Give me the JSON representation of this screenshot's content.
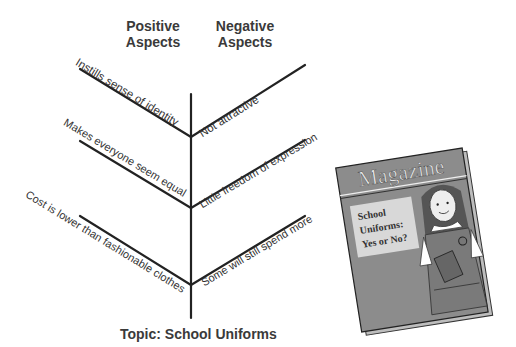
{
  "diagram": {
    "type": "fishbone",
    "headers": {
      "positive": [
        "Positive",
        "Aspects"
      ],
      "negative": [
        "Negative",
        "Aspects"
      ]
    },
    "topic": "Topic: School Uniforms",
    "positive_items": [
      "Instills sense of identity",
      "Makes everyone seem equal",
      "Cost is lower than fashionable clothes"
    ],
    "negative_items": [
      "Not attractive",
      "Little freedom of expression",
      "Some will still spend more"
    ]
  },
  "magazine": {
    "title": "Magazine",
    "cover_lines": [
      "School",
      "Uniforms:",
      "Yes or No?"
    ]
  },
  "colors": {
    "line": "#222222",
    "magazine_cover": "#8c8c8c",
    "magazine_box": "#d8d8d8"
  }
}
